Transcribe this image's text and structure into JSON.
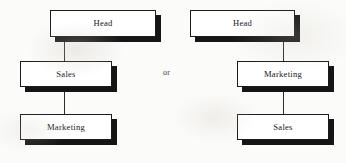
{
  "figure": {
    "type": "org-chart-comparison",
    "background_color": "#fbfbf9",
    "box_fill": "#ffffff",
    "box_border_color": "#1b1b1b",
    "shadow_color": "#151515",
    "line_color": "#2b2b2b",
    "separator_label": "or"
  },
  "charts": [
    {
      "id": "left-variant",
      "nodes": [
        {
          "id": "left-head",
          "label": "Head",
          "level": 0,
          "x": 50,
          "y": 10,
          "w": 106,
          "h": 27
        },
        {
          "id": "left-sales",
          "label": "Sales",
          "level": 1,
          "x": 20,
          "y": 61,
          "w": 92,
          "h": 26
        },
        {
          "id": "left-marketing",
          "label": "Marketing",
          "level": 2,
          "x": 20,
          "y": 114,
          "w": 92,
          "h": 26
        }
      ],
      "edges": [
        {
          "id": "left-edge-head-sales",
          "from": "left-head",
          "to": "left-sales",
          "x": 64,
          "y": 37,
          "length": 24
        },
        {
          "id": "left-edge-sales-marketing",
          "from": "left-sales",
          "to": "left-marketing",
          "x": 64,
          "y": 87,
          "length": 27
        }
      ]
    },
    {
      "id": "right-variant",
      "nodes": [
        {
          "id": "right-head",
          "label": "Head",
          "level": 0,
          "x": 190,
          "y": 10,
          "w": 105,
          "h": 27
        },
        {
          "id": "right-marketing",
          "label": "Marketing",
          "level": 1,
          "x": 237,
          "y": 61,
          "w": 92,
          "h": 26
        },
        {
          "id": "right-sales",
          "label": "Sales",
          "level": 2,
          "x": 237,
          "y": 114,
          "w": 92,
          "h": 26
        }
      ],
      "edges": [
        {
          "id": "right-edge-head-marketing",
          "from": "right-head",
          "to": "right-marketing",
          "x": 283,
          "y": 37,
          "length": 24
        },
        {
          "id": "right-edge-marketing-sales",
          "from": "right-marketing",
          "to": "right-sales",
          "x": 283,
          "y": 87,
          "length": 27
        }
      ]
    }
  ],
  "separator": {
    "label": "or",
    "x": 163,
    "y": 68
  }
}
